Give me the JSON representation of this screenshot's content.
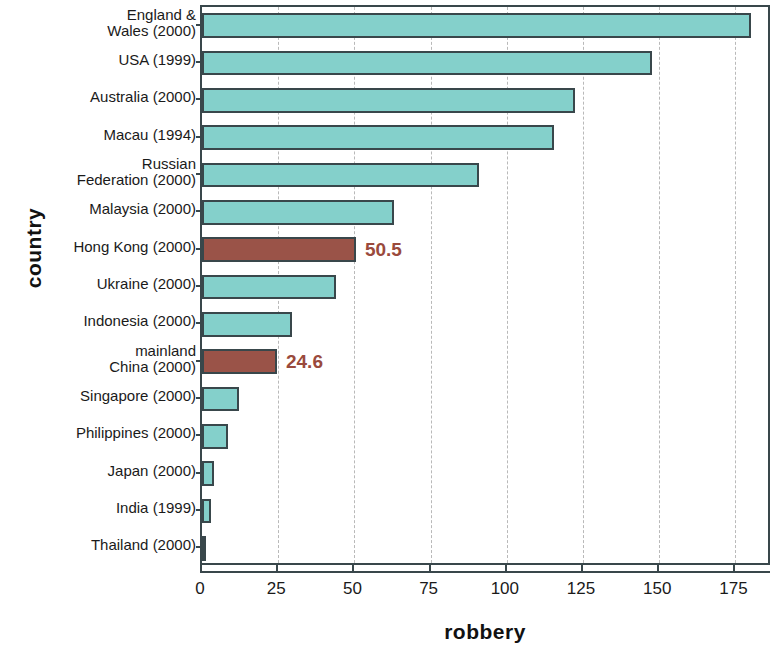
{
  "chart_data": {
    "type": "bar",
    "orientation": "horizontal",
    "title": "",
    "xlabel": "robbery",
    "ylabel": "country",
    "xlim": [
      0,
      187
    ],
    "xticks": [
      0,
      25,
      50,
      75,
      100,
      125,
      150,
      175
    ],
    "xtick_labels": [
      "0",
      "25",
      "50",
      "75",
      "100",
      "125",
      "150",
      "175"
    ],
    "grid": "vertical-dashed",
    "legend": null,
    "categories": [
      "England &\nWales (2000)",
      "USA (1999)",
      "Australia (2000)",
      "Macau (1994)",
      "Russian\nFederation (2000)",
      "Malaysia (2000)",
      "Hong Kong (2000)",
      "Ukraine (2000)",
      "Indonesia (2000)",
      "mainland\nChina (2000)",
      "Singapore (2000)",
      "Philippines (2000)",
      "Japan (2000)",
      "India (1999)",
      "Thailand (2000)"
    ],
    "values": [
      180.0,
      147.5,
      122.5,
      115.5,
      91.0,
      63.0,
      50.5,
      44.0,
      29.5,
      24.6,
      12.0,
      8.5,
      4.1,
      3.0,
      1.2
    ],
    "highlighted": [
      "Hong Kong (2000)",
      "mainland\nChina (2000)"
    ],
    "data_labels": {
      "Hong Kong (2000)": "50.5",
      "mainland\nChina (2000)": "24.6"
    },
    "colors": {
      "bar": "#84d0cb",
      "bar_highlight": "#9a5348",
      "bar_border": "#39474b",
      "data_label": "#9a4a3c",
      "gridline": "#b9b9b9",
      "background": "#ffffff"
    }
  },
  "bars": [
    {
      "label_line1": "England &",
      "label_line2": "Wales (2000)",
      "value": 180.0,
      "highlight": false,
      "data_label": ""
    },
    {
      "label_line1": "USA (1999)",
      "label_line2": "",
      "value": 147.5,
      "highlight": false,
      "data_label": ""
    },
    {
      "label_line1": "Australia (2000)",
      "label_line2": "",
      "value": 122.5,
      "highlight": false,
      "data_label": ""
    },
    {
      "label_line1": "Macau (1994)",
      "label_line2": "",
      "value": 115.5,
      "highlight": false,
      "data_label": ""
    },
    {
      "label_line1": "Russian",
      "label_line2": "Federation (2000)",
      "value": 91.0,
      "highlight": false,
      "data_label": ""
    },
    {
      "label_line1": "Malaysia (2000)",
      "label_line2": "",
      "value": 63.0,
      "highlight": false,
      "data_label": ""
    },
    {
      "label_line1": "Hong Kong (2000)",
      "label_line2": "",
      "value": 50.5,
      "highlight": true,
      "data_label": "50.5"
    },
    {
      "label_line1": "Ukraine (2000)",
      "label_line2": "",
      "value": 44.0,
      "highlight": false,
      "data_label": ""
    },
    {
      "label_line1": "Indonesia (2000)",
      "label_line2": "",
      "value": 29.5,
      "highlight": false,
      "data_label": ""
    },
    {
      "label_line1": "mainland",
      "label_line2": "China (2000)",
      "value": 24.6,
      "highlight": true,
      "data_label": "24.6"
    },
    {
      "label_line1": "Singapore (2000)",
      "label_line2": "",
      "value": 12.0,
      "highlight": false,
      "data_label": ""
    },
    {
      "label_line1": "Philippines (2000)",
      "label_line2": "",
      "value": 8.5,
      "highlight": false,
      "data_label": ""
    },
    {
      "label_line1": "Japan (2000)",
      "label_line2": "",
      "value": 4.1,
      "highlight": false,
      "data_label": ""
    },
    {
      "label_line1": "India (1999)",
      "label_line2": "",
      "value": 3.0,
      "highlight": false,
      "data_label": ""
    },
    {
      "label_line1": "Thailand (2000)",
      "label_line2": "",
      "value": 1.2,
      "highlight": false,
      "data_label": ""
    }
  ],
  "axis": {
    "y_title": "country",
    "x_title": "robbery",
    "x_ticks": [
      "0",
      "25",
      "50",
      "75",
      "100",
      "125",
      "150",
      "175"
    ]
  }
}
